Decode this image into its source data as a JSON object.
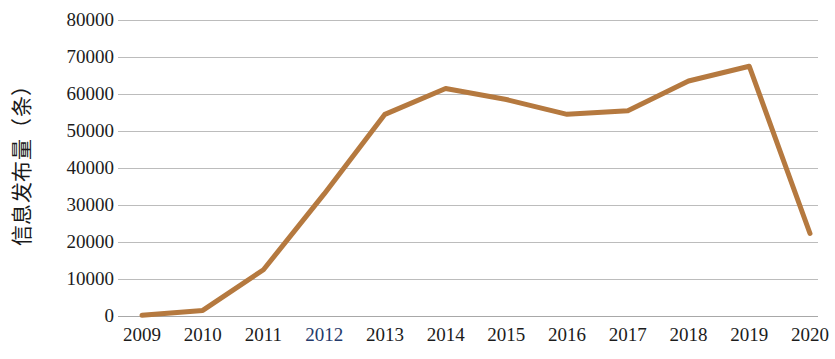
{
  "chart_data": {
    "type": "line",
    "title": "",
    "xlabel": "",
    "ylabel": "信息发布量（条）",
    "categories": [
      "2009",
      "2010",
      "2011",
      "2012",
      "2013",
      "2014",
      "2015",
      "2016",
      "2017",
      "2018",
      "2019",
      "2020"
    ],
    "values": [
      200,
      1500,
      12500,
      33000,
      54500,
      61500,
      58500,
      54500,
      55500,
      63500,
      67500,
      22300
    ],
    "series": [
      {
        "name": "信息发布量（条）",
        "values": [
          200,
          1500,
          12500,
          33000,
          54500,
          61500,
          58500,
          54500,
          55500,
          63500,
          67500,
          22300
        ]
      }
    ],
    "ylim": [
      0,
      80000
    ],
    "y_ticks": [
      "80000",
      "70000",
      "60000",
      "50000",
      "40000",
      "30000",
      "20000",
      "10000",
      "0"
    ],
    "y_tick_values": [
      80000,
      70000,
      60000,
      50000,
      40000,
      30000,
      20000,
      10000,
      0
    ],
    "grid": true,
    "legend": false,
    "legend_position": "none",
    "line_color": "#b5793f",
    "grid_color": "#bcbcbc",
    "background_color": "#ffffff",
    "markers": false
  }
}
